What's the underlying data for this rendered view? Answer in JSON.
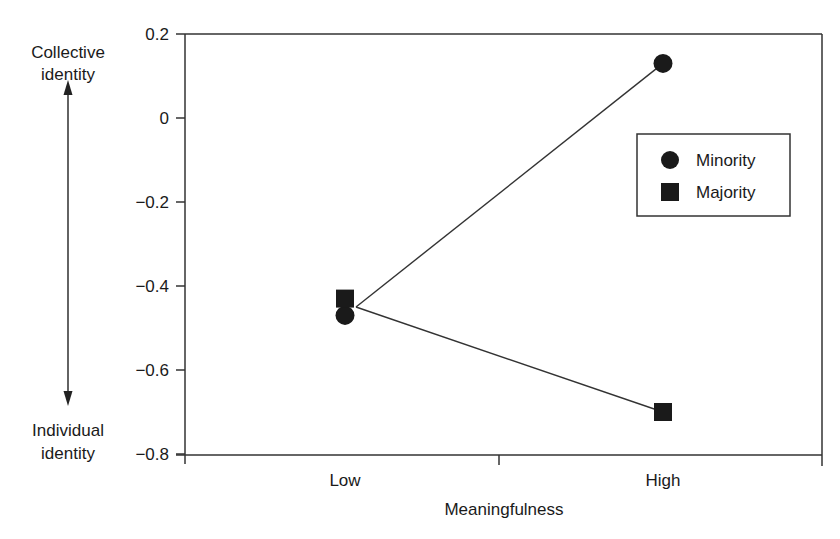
{
  "chart_data": {
    "type": "line",
    "title": "",
    "xlabel": "Meaningfulness",
    "ylabel": "",
    "categories": [
      "Low",
      "High"
    ],
    "series": [
      {
        "name": "Minority",
        "marker": "circle",
        "values": [
          -0.47,
          0.13
        ]
      },
      {
        "name": "Majority",
        "marker": "square",
        "values": [
          -0.43,
          -0.7
        ]
      }
    ],
    "ylim": [
      -0.8,
      0.2
    ],
    "yticks": [
      "0.2",
      "0",
      "−0.2",
      "−0.4",
      "−0.6",
      "−0.8"
    ],
    "ytick_values": [
      0.2,
      0,
      -0.2,
      -0.4,
      -0.6,
      -0.8
    ],
    "grid": false,
    "legend_position": "upper right",
    "annotations": {
      "top": [
        "Collective",
        "identity"
      ],
      "bottom": [
        "Individual",
        "identity"
      ],
      "arrow": "double-headed vertical"
    }
  },
  "colors": {
    "ink": "#1a1a1a",
    "background": "#ffffff"
  }
}
